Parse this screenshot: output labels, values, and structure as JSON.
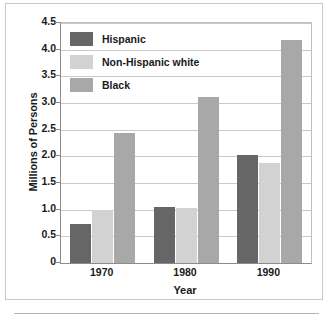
{
  "chart_data": {
    "type": "bar",
    "title": "",
    "subtitle": "",
    "xlabel": "Year",
    "ylabel": "Millions of Persons",
    "categories": [
      "1970",
      "1980",
      "1990"
    ],
    "series": [
      {
        "name": "Hispanic",
        "color": "#666666",
        "values": [
          0.74,
          1.05,
          2.02
        ]
      },
      {
        "name": "Non-Hispanic white",
        "color": "#d2d2d2",
        "values": [
          1.0,
          1.03,
          1.87
        ]
      },
      {
        "name": "Black",
        "color": "#a8a8a8",
        "values": [
          2.44,
          3.11,
          4.18
        ]
      }
    ],
    "ylim": [
      0,
      4.5
    ],
    "yticks": [
      "0",
      "0.5",
      "1.0",
      "1.5",
      "2.0",
      "2.5",
      "3.0",
      "3.5",
      "4.0",
      "4.5"
    ],
    "ytick_values": [
      0,
      0.5,
      1.0,
      1.5,
      2.0,
      2.5,
      3.0,
      3.5,
      4.0,
      4.5
    ],
    "grid": true,
    "grid_axis": "y",
    "legend_position": "upper-left"
  },
  "legend": {
    "items": [
      {
        "label": "Hispanic"
      },
      {
        "label": "Non-Hispanic white"
      },
      {
        "label": "Black"
      }
    ]
  },
  "axes": {
    "y_title": "Millions of Persons",
    "x_title": "Year"
  }
}
